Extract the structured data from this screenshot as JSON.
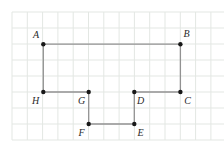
{
  "figure": {
    "width": 224,
    "height": 149,
    "background_color": "#ffffff",
    "grid": {
      "color": "#e3e7e3",
      "stroke_width": 1,
      "origin_x": 12,
      "origin_y": 12,
      "spacing_x": 15.3,
      "spacing_y": 16,
      "cols": 14,
      "rows": 8
    },
    "style": {
      "edge_color": "#929292",
      "edge_width": 1.3,
      "dot_color": "#181818",
      "dot_radius": 2.2,
      "label_color": "#2a2a2a",
      "label_font_size": 10
    },
    "vertices": [
      {
        "label": "A",
        "x": 43.3,
        "y": 44.2,
        "label_x": 36,
        "label_y": 34
      },
      {
        "label": "B",
        "x": 180.4,
        "y": 44.2,
        "label_x": 186.5,
        "label_y": 33.5
      },
      {
        "label": "C",
        "x": 180.4,
        "y": 92,
        "label_x": 187.5,
        "label_y": 100
      },
      {
        "label": "D",
        "x": 134.3,
        "y": 92,
        "label_x": 140.5,
        "label_y": 100
      },
      {
        "label": "E",
        "x": 134.3,
        "y": 124,
        "label_x": 140.5,
        "label_y": 132.5
      },
      {
        "label": "F",
        "x": 88.7,
        "y": 124,
        "label_x": 81.5,
        "label_y": 132.5
      },
      {
        "label": "G",
        "x": 88.7,
        "y": 92,
        "label_x": 81.5,
        "label_y": 100
      },
      {
        "label": "H",
        "x": 43.3,
        "y": 92,
        "label_x": 35.5,
        "label_y": 100
      }
    ],
    "edges": [
      [
        "A",
        "B"
      ],
      [
        "B",
        "C"
      ],
      [
        "C",
        "D"
      ],
      [
        "D",
        "E"
      ],
      [
        "E",
        "F"
      ],
      [
        "F",
        "G"
      ],
      [
        "G",
        "H"
      ],
      [
        "H",
        "A"
      ]
    ]
  }
}
